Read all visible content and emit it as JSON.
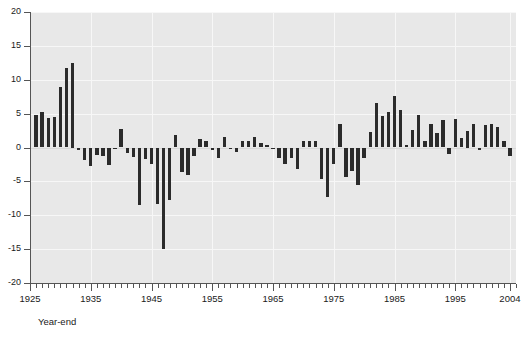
{
  "chart_data": {
    "type": "bar",
    "title": "",
    "subtitle": "",
    "xlabel": "Year-end",
    "ylabel": "",
    "ylim": [
      -20,
      20
    ],
    "xlim": [
      1925,
      2005
    ],
    "ytick_labels": [
      "20",
      "15",
      "10",
      "5",
      "0",
      "-5",
      "-10",
      "-15",
      "-20"
    ],
    "ytick_values": [
      20,
      15,
      10,
      5,
      0,
      -5,
      -10,
      -15,
      -20
    ],
    "xtick_labels": [
      "1925",
      "1935",
      "1945",
      "1955",
      "1965",
      "1975",
      "1985",
      "1995",
      "2004"
    ],
    "xtick_values": [
      1925,
      1935,
      1945,
      1955,
      1965,
      1975,
      1985,
      1995,
      2004
    ],
    "xtick_minor_step": 1,
    "grid": true,
    "grid_color": "#f7f7f7",
    "plot_background": "#e8e8e8",
    "bar_color": "#2b2b2b",
    "legend": null,
    "legend_position": "none",
    "annotations": [],
    "categories": [
      1926,
      1927,
      1928,
      1929,
      1930,
      1931,
      1932,
      1933,
      1934,
      1935,
      1936,
      1937,
      1938,
      1939,
      1940,
      1941,
      1942,
      1943,
      1944,
      1945,
      1946,
      1947,
      1948,
      1949,
      1950,
      1951,
      1952,
      1953,
      1954,
      1955,
      1956,
      1957,
      1958,
      1959,
      1960,
      1961,
      1962,
      1963,
      1964,
      1965,
      1966,
      1967,
      1968,
      1969,
      1970,
      1971,
      1972,
      1973,
      1974,
      1975,
      1976,
      1977,
      1978,
      1979,
      1980,
      1981,
      1982,
      1983,
      1984,
      1985,
      1986,
      1987,
      1988,
      1989,
      1990,
      1991,
      1992,
      1993,
      1994,
      1995,
      1996,
      1997,
      1998,
      1999,
      2000,
      2001,
      2002,
      2003,
      2004
    ],
    "values": [
      4.8,
      5.3,
      4.4,
      4.5,
      9.0,
      11.8,
      12.5,
      -0.3,
      -1.8,
      -2.7,
      -1.1,
      -1.3,
      -2.6,
      -0.2,
      2.7,
      -0.8,
      -1.4,
      -8.5,
      -1.7,
      -2.5,
      -8.3,
      -15.0,
      -7.8,
      1.8,
      -3.6,
      -4.0,
      -1.3,
      1.2,
      1.0,
      -0.3,
      -1.6,
      1.5,
      -0.2,
      -0.6,
      1.0,
      0.9,
      1.5,
      0.6,
      0.4,
      -0.1,
      -1.6,
      -2.4,
      -1.5,
      -3.1,
      1.0,
      1.0,
      0.9,
      -4.6,
      -7.3,
      -2.5,
      3.5,
      -4.3,
      -3.4,
      -5.6,
      -1.5,
      2.3,
      6.5,
      4.6,
      5.2,
      7.6,
      5.6,
      0.4,
      2.6,
      4.8,
      1.0,
      3.5,
      2.1,
      4.0,
      -1.0,
      4.2,
      1.4,
      2.5,
      3.5,
      -0.4,
      3.3,
      3.5,
      3.0,
      1.0,
      -1.2
    ]
  }
}
